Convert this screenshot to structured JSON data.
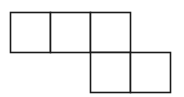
{
  "diagram": {
    "type": "square-net",
    "stroke_color": "#1a1a1a",
    "fill_color": "#ffffff",
    "square_size": 40,
    "squares": [
      {
        "x": 10,
        "y": 12
      },
      {
        "x": 50,
        "y": 12
      },
      {
        "x": 90,
        "y": 12
      },
      {
        "x": 90,
        "y": 52
      },
      {
        "x": 130,
        "y": 52
      }
    ]
  }
}
